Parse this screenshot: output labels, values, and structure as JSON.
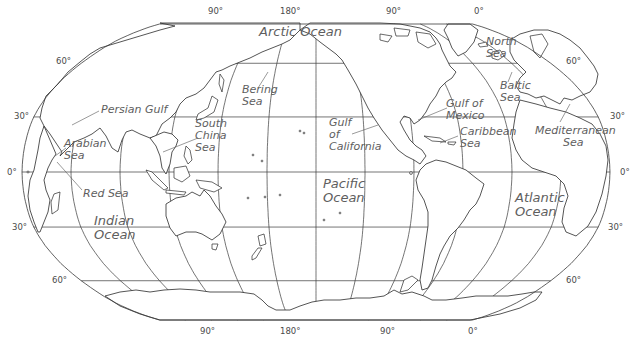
{
  "map": {
    "projection": "Robinson-like world map, centered near 150°W",
    "colors": {
      "line": "#3a3a3a",
      "land_fill": "#ffffff",
      "label": "#5e5e5e",
      "background": "#ffffff"
    },
    "graticule": {
      "meridian_spacing_deg": 30,
      "parallels_deg": [
        60,
        30,
        0,
        -30,
        -60
      ]
    },
    "top_longitude_labels": [
      {
        "text": "90°",
        "x": 208,
        "y": 6
      },
      {
        "text": "180°",
        "x": 280,
        "y": 6
      },
      {
        "text": "90°",
        "x": 386,
        "y": 6
      },
      {
        "text": "0°",
        "x": 474,
        "y": 6
      }
    ],
    "bottom_longitude_labels": [
      {
        "text": "90°",
        "x": 200,
        "y": 326
      },
      {
        "text": "180°",
        "x": 280,
        "y": 326
      },
      {
        "text": "90°",
        "x": 380,
        "y": 326
      },
      {
        "text": "0°",
        "x": 468,
        "y": 326
      }
    ],
    "left_latitude_labels": [
      {
        "text": "60°",
        "x": 56,
        "y": 56
      },
      {
        "text": "30°",
        "x": 14,
        "y": 111
      },
      {
        "text": "0°",
        "x": 7,
        "y": 167
      },
      {
        "text": "30°",
        "x": 12,
        "y": 222
      },
      {
        "text": "60°",
        "x": 52,
        "y": 275
      }
    ],
    "right_latitude_labels": [
      {
        "text": "60°",
        "x": 566,
        "y": 56
      },
      {
        "text": "30°",
        "x": 610,
        "y": 111
      },
      {
        "text": "0°",
        "x": 620,
        "y": 167
      },
      {
        "text": "30°",
        "x": 608,
        "y": 222
      },
      {
        "text": "60°",
        "x": 566,
        "y": 275
      }
    ],
    "water_labels": [
      {
        "id": "arctic-ocean",
        "text": "Arctic Ocean",
        "x": 259,
        "y": 25,
        "size": "lg"
      },
      {
        "id": "north-sea",
        "text": "North\nSea",
        "x": 486,
        "y": 36,
        "size": "sm"
      },
      {
        "id": "bering-sea",
        "text": "Bering\nSea",
        "x": 242,
        "y": 84,
        "size": "sm"
      },
      {
        "id": "baltic-sea",
        "text": "Baltic\nSea",
        "x": 500,
        "y": 80,
        "size": "sm"
      },
      {
        "id": "persian-gulf",
        "text": "Persian Gulf",
        "x": 101,
        "y": 104,
        "size": "sm"
      },
      {
        "id": "gulf-of-mexico",
        "text": "Gulf of\nMexico",
        "x": 446,
        "y": 98,
        "size": "sm"
      },
      {
        "id": "south-china-sea",
        "text": "South\nChina\nSea",
        "x": 195,
        "y": 118,
        "size": "sm"
      },
      {
        "id": "gulf-of-california",
        "text": "Gulf\nof\nCalifornia",
        "x": 329,
        "y": 117,
        "size": "sm"
      },
      {
        "id": "caribbean-sea",
        "text": "Caribbean\nSea",
        "x": 460,
        "y": 126,
        "size": "sm"
      },
      {
        "id": "mediterranean-sea",
        "text": "Mediterranean\n        Sea",
        "x": 535,
        "y": 125,
        "size": "sm"
      },
      {
        "id": "arabian-sea",
        "text": "Arabian\nSea",
        "x": 64,
        "y": 138,
        "size": "sm"
      },
      {
        "id": "red-sea",
        "text": "Red Sea",
        "x": 83,
        "y": 188,
        "size": "sm"
      },
      {
        "id": "pacific-ocean",
        "text": "Pacific\nOcean",
        "x": 323,
        "y": 177,
        "size": "lg"
      },
      {
        "id": "atlantic-ocean",
        "text": "Atlantic\nOcean",
        "x": 515,
        "y": 191,
        "size": "lg"
      },
      {
        "id": "indian-ocean",
        "text": "Indian\nOcean",
        "x": 94,
        "y": 214,
        "size": "lg"
      }
    ],
    "leaders": [
      {
        "for": "persian-gulf",
        "x1": 99,
        "y1": 111,
        "x2": 72,
        "y2": 125
      },
      {
        "for": "south-china-sea",
        "x1": 198,
        "y1": 138,
        "x2": 163,
        "y2": 152
      },
      {
        "for": "bering-sea",
        "x1": 268,
        "y1": 72,
        "x2": 258,
        "y2": 88
      },
      {
        "for": "gulf-of-california",
        "x1": 352,
        "y1": 134,
        "x2": 378,
        "y2": 125
      },
      {
        "for": "gulf-of-mexico",
        "x1": 447,
        "y1": 108,
        "x2": 418,
        "y2": 120
      },
      {
        "for": "caribbean-sea",
        "x1": 458,
        "y1": 136,
        "x2": 440,
        "y2": 143
      },
      {
        "for": "mediterranean-sea",
        "x1": 560,
        "y1": 122,
        "x2": 570,
        "y2": 104
      },
      {
        "for": "baltic-sea",
        "x1": 508,
        "y1": 82,
        "x2": 512,
        "y2": 72
      },
      {
        "for": "north-sea",
        "x1": 500,
        "y1": 52,
        "x2": 488,
        "y2": 56
      },
      {
        "for": "red-sea",
        "x1": 82,
        "y1": 190,
        "x2": 57,
        "y2": 162
      },
      {
        "for": "arabian-sea",
        "x1": 66,
        "y1": 148,
        "x2": 55,
        "y2": 156
      }
    ]
  }
}
